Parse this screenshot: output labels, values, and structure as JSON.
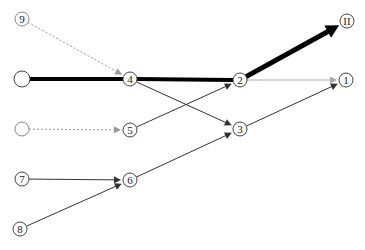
{
  "diagram": {
    "type": "directed-graph",
    "nodes": [
      {
        "id": "n9",
        "label": "9",
        "x": 22,
        "y": 19,
        "r": 7,
        "stroke": "#888888"
      },
      {
        "id": "src_a",
        "label": "",
        "x": 22,
        "y": 79,
        "r": 8,
        "stroke": "#444444"
      },
      {
        "id": "n4",
        "label": "4",
        "x": 130,
        "y": 79,
        "r": 7,
        "stroke": "#444444"
      },
      {
        "id": "n2",
        "label": "2",
        "x": 240,
        "y": 80,
        "r": 7,
        "stroke": "#444444"
      },
      {
        "id": "nII",
        "label": "II",
        "x": 347,
        "y": 21,
        "r": 7,
        "stroke": "#444444"
      },
      {
        "id": "n1",
        "label": "1",
        "x": 346,
        "y": 80,
        "r": 7,
        "stroke": "#444444"
      },
      {
        "id": "src_b",
        "label": "",
        "x": 22,
        "y": 129,
        "r": 7,
        "stroke": "#888888"
      },
      {
        "id": "n5",
        "label": "5",
        "x": 130,
        "y": 130,
        "r": 7,
        "stroke": "#444444"
      },
      {
        "id": "n3",
        "label": "3",
        "x": 240,
        "y": 129,
        "r": 7,
        "stroke": "#444444"
      },
      {
        "id": "n7",
        "label": "7",
        "x": 22,
        "y": 179,
        "r": 7,
        "stroke": "#444444"
      },
      {
        "id": "n6",
        "label": "6",
        "x": 130,
        "y": 180,
        "r": 7,
        "stroke": "#444444"
      },
      {
        "id": "n8",
        "label": "8",
        "x": 20,
        "y": 229,
        "r": 7,
        "stroke": "#444444"
      }
    ],
    "edges": [
      {
        "from": "n9",
        "to": "n4",
        "style": "dashed",
        "color": "#999999",
        "width": 1,
        "arrow": true
      },
      {
        "from": "src_a",
        "to": "n4",
        "style": "solid",
        "color": "#000000",
        "width": 4,
        "arrow": false
      },
      {
        "from": "n4",
        "to": "n2",
        "style": "solid",
        "color": "#000000",
        "width": 4,
        "arrow": false
      },
      {
        "from": "n2",
        "to": "nII",
        "style": "solid",
        "color": "#000000",
        "width": 5,
        "arrow": true
      },
      {
        "from": "n2",
        "to": "n1",
        "style": "solid",
        "color": "#aaaaaa",
        "width": 1,
        "arrow": true
      },
      {
        "from": "n4",
        "to": "n3",
        "style": "solid",
        "color": "#333333",
        "width": 1,
        "arrow": true
      },
      {
        "from": "n5",
        "to": "n2",
        "style": "solid",
        "color": "#333333",
        "width": 1,
        "arrow": true
      },
      {
        "from": "src_b",
        "to": "n5",
        "style": "dashed",
        "color": "#999999",
        "width": 1,
        "arrow": true
      },
      {
        "from": "n3",
        "to": "n1",
        "style": "solid",
        "color": "#333333",
        "width": 1,
        "arrow": true
      },
      {
        "from": "n7",
        "to": "n6",
        "style": "solid",
        "color": "#333333",
        "width": 1,
        "arrow": true
      },
      {
        "from": "n8",
        "to": "n6",
        "style": "solid",
        "color": "#333333",
        "width": 1,
        "arrow": true
      },
      {
        "from": "n6",
        "to": "n3",
        "style": "solid",
        "color": "#333333",
        "width": 1,
        "arrow": true
      }
    ]
  }
}
